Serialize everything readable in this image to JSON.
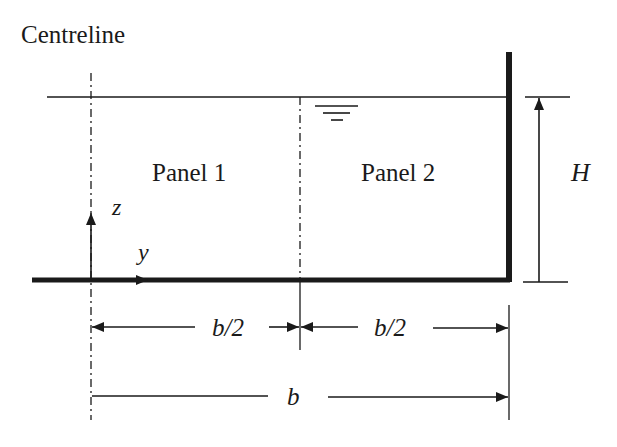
{
  "title": "Centreline",
  "labels": {
    "panel1": "Panel 1",
    "panel2": "Panel 2",
    "height": "H",
    "z_axis": "z",
    "y_axis": "y",
    "half_width_left": "b/2",
    "half_width_right": "b/2",
    "full_width": "b"
  },
  "symbols": {
    "water_surface": "free-surface-symbol"
  },
  "colors": {
    "line": "#1a1a1a",
    "background": "#ffffff"
  }
}
